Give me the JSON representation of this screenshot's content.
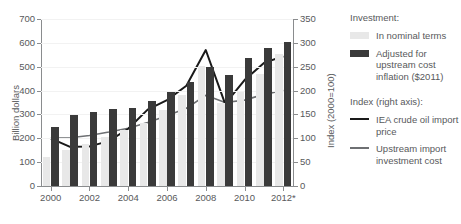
{
  "chart_data": {
    "type": "bar",
    "title": "",
    "categories": [
      2000,
      2001,
      2002,
      2003,
      2004,
      2005,
      2006,
      2007,
      2008,
      2009,
      2010,
      2011,
      2012
    ],
    "x_tick_labels": [
      "2000",
      "2002",
      "2004",
      "2006",
      "2008",
      "2010",
      "2012*"
    ],
    "x_tick_years": [
      2000,
      2002,
      2004,
      2006,
      2008,
      2010,
      2012
    ],
    "xlabel": "",
    "ylabel": "Billion dollars",
    "ylim": [
      0,
      700
    ],
    "y_ticks": [
      0,
      100,
      200,
      300,
      400,
      500,
      600,
      700
    ],
    "y2label": "Index (2000=100)",
    "y2lim": [
      0,
      350
    ],
    "y2_ticks": [
      0,
      50,
      100,
      150,
      200,
      250,
      300,
      350
    ],
    "grid": true,
    "legend_position": "right",
    "series": [
      {
        "name": "In nominal terms",
        "axis": "left",
        "kind": "bar",
        "color": "#e8e8e8",
        "values": [
          120,
          150,
          175,
          205,
          235,
          265,
          320,
          380,
          505,
          350,
          395,
          470,
          555
        ]
      },
      {
        "name": "Adjusted for upstream cost inflation ($2011)",
        "axis": "left",
        "kind": "bar",
        "color": "#3a3a3a",
        "values": [
          248,
          297,
          312,
          323,
          329,
          357,
          392,
          437,
          497,
          465,
          535,
          578,
          605
        ]
      },
      {
        "name": "IEA crude oil import price",
        "axis": "right",
        "kind": "line",
        "color": "#1a1a1a",
        "values": [
          100,
          82,
          83,
          94,
          120,
          160,
          180,
          210,
          285,
          172,
          222,
          258,
          272
        ]
      },
      {
        "name": "Upstream import investment cost",
        "axis": "right",
        "kind": "line",
        "color": "#6e7073",
        "values": [
          100,
          101,
          106,
          113,
          121,
          133,
          147,
          163,
          190,
          175,
          180,
          192,
          200
        ]
      }
    ]
  },
  "legend": {
    "investment_heading": "Investment:",
    "index_heading": "Index (right axis):",
    "items": [
      {
        "label": "In nominal terms",
        "marker": "swatch-light"
      },
      {
        "label": "Adjusted for upstream cost inflation ($2011)",
        "marker": "swatch-dark"
      },
      {
        "label": "IEA crude oil import price",
        "marker": "line-dark"
      },
      {
        "label": "Upstream import investment cost",
        "marker": "line-gray"
      }
    ]
  },
  "axes": {
    "left_title": "Billion dollars",
    "right_title": "Index (2000=100)"
  }
}
